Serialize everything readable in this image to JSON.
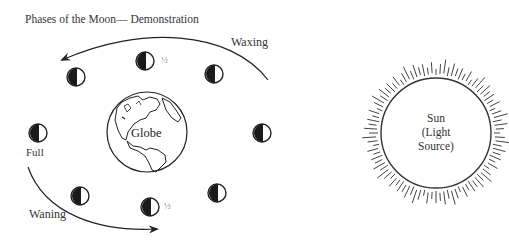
{
  "title": "Phases of the Moon— Demonstration",
  "labels": {
    "waxing": "Waxing",
    "waning": "Waning",
    "full": "Full",
    "globe": "Globe",
    "half_top": "½",
    "half_bottom": "½"
  },
  "sun": {
    "line1": "Sun",
    "line2": "(Light",
    "line3": "Source)"
  },
  "moons": [
    {
      "position": "top-left",
      "x": 76,
      "y": 77
    },
    {
      "position": "top",
      "x": 145,
      "y": 61
    },
    {
      "position": "top-right",
      "x": 214,
      "y": 74
    },
    {
      "position": "left",
      "x": 38,
      "y": 133
    },
    {
      "position": "right",
      "x": 262,
      "y": 133
    },
    {
      "position": "bottom-left",
      "x": 80,
      "y": 196
    },
    {
      "position": "bottom",
      "x": 150,
      "y": 207
    },
    {
      "position": "bottom-right",
      "x": 217,
      "y": 193
    }
  ],
  "colors": {
    "ink": "#222222",
    "background": "#ffffff"
  }
}
